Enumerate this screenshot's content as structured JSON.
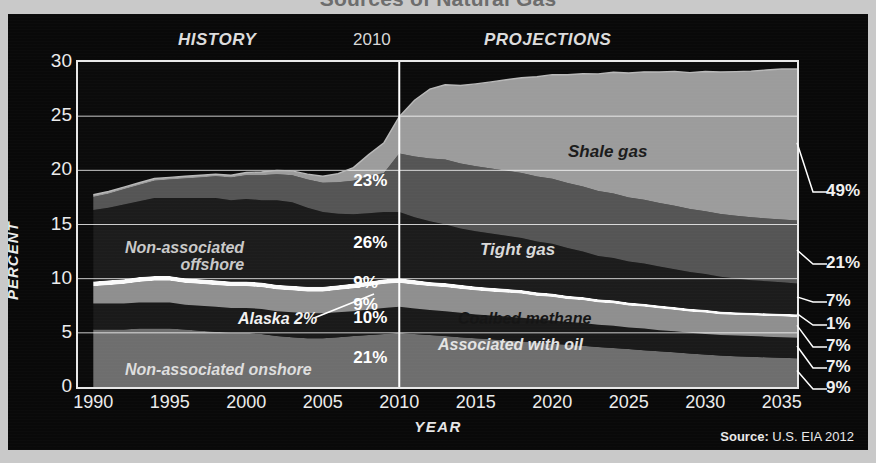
{
  "headline": "Sources of Natural Gas",
  "header": {
    "history": "HISTORY",
    "divider_year": "2010",
    "projections": "PROJECTIONS"
  },
  "source": {
    "prefix": "Source:",
    "text": " U.S. EIA 2012"
  },
  "chart_data": {
    "type": "area",
    "title": "Sources of Natural Gas",
    "xlabel": "YEAR",
    "ylabel": "PERCENT",
    "xlim": [
      1989,
      2036
    ],
    "ylim": [
      0,
      30
    ],
    "yticks": [
      0,
      5,
      10,
      15,
      20,
      25,
      30
    ],
    "ytick_labels": [
      "0",
      "5",
      "10",
      "15",
      "20",
      "25",
      "30"
    ],
    "xticks": [
      1990,
      1995,
      2000,
      2005,
      2010,
      2015,
      2020,
      2025,
      2030,
      2035
    ],
    "xtick_labels": [
      "1990",
      "1995",
      "2000",
      "2005",
      "2010",
      "2015",
      "2020",
      "2025",
      "2030",
      "2035"
    ],
    "grid": true,
    "legend": "in-plot labels",
    "divider_x": 2010,
    "stacked": true,
    "x": [
      1990,
      1991,
      1992,
      1993,
      1994,
      1995,
      1996,
      1997,
      1998,
      1999,
      2000,
      2001,
      2002,
      2003,
      2004,
      2005,
      2006,
      2007,
      2008,
      2009,
      2010,
      2011,
      2012,
      2013,
      2014,
      2015,
      2016,
      2017,
      2018,
      2019,
      2020,
      2021,
      2022,
      2023,
      2024,
      2025,
      2026,
      2027,
      2028,
      2029,
      2030,
      2031,
      2032,
      2033,
      2034,
      2035,
      2036
    ],
    "series": [
      {
        "name": "Non-associated onshore",
        "color": "#6e6e6e",
        "label_2010": "21%",
        "label_2035": "9%",
        "values": [
          5.3,
          5.3,
          5.3,
          5.4,
          5.4,
          5.4,
          5.3,
          5.2,
          5.1,
          5.0,
          5.0,
          4.9,
          4.7,
          4.6,
          4.5,
          4.5,
          4.6,
          4.7,
          4.8,
          4.9,
          5.0,
          4.9,
          4.8,
          4.7,
          4.6,
          4.5,
          4.4,
          4.3,
          4.2,
          4.1,
          4.0,
          3.9,
          3.8,
          3.7,
          3.6,
          3.5,
          3.4,
          3.3,
          3.2,
          3.1,
          3.0,
          2.9,
          2.85,
          2.8,
          2.75,
          2.7,
          2.65
        ]
      },
      {
        "name": "Associated with oil",
        "color": "#1a1a1a",
        "label_2010": "10%",
        "label_2035": "7%",
        "values": [
          2.4,
          2.4,
          2.4,
          2.4,
          2.4,
          2.4,
          2.3,
          2.3,
          2.3,
          2.3,
          2.3,
          2.3,
          2.3,
          2.3,
          2.3,
          2.3,
          2.3,
          2.3,
          2.35,
          2.4,
          2.4,
          2.35,
          2.3,
          2.3,
          2.25,
          2.2,
          2.2,
          2.2,
          2.2,
          2.15,
          2.15,
          2.1,
          2.1,
          2.05,
          2.05,
          2.0,
          2.0,
          1.95,
          1.95,
          1.9,
          1.9,
          1.9,
          1.9,
          1.9,
          1.9,
          1.9,
          1.9
        ]
      },
      {
        "name": "Coalbed methane",
        "color": "#8f8f8f",
        "label_2010": "9%",
        "label_2035": "7%",
        "values": [
          1.6,
          1.7,
          1.8,
          1.9,
          2.0,
          2.0,
          2.0,
          2.0,
          2.0,
          2.0,
          2.0,
          2.0,
          2.0,
          2.0,
          2.0,
          2.0,
          2.05,
          2.1,
          2.15,
          2.2,
          2.2,
          2.2,
          2.2,
          2.2,
          2.2,
          2.2,
          2.2,
          2.2,
          2.2,
          2.15,
          2.15,
          2.1,
          2.1,
          2.05,
          2.05,
          2.0,
          2.0,
          2.0,
          1.95,
          1.95,
          1.95,
          1.9,
          1.9,
          1.9,
          1.9,
          1.9,
          1.9
        ]
      },
      {
        "name": "Alaska",
        "color": "#fafafa",
        "label_2010": "2%",
        "label_2035": "1%",
        "values": [
          0.45,
          0.45,
          0.45,
          0.45,
          0.45,
          0.45,
          0.45,
          0.45,
          0.45,
          0.45,
          0.45,
          0.45,
          0.45,
          0.45,
          0.45,
          0.45,
          0.45,
          0.45,
          0.45,
          0.45,
          0.45,
          0.42,
          0.4,
          0.4,
          0.38,
          0.38,
          0.36,
          0.36,
          0.35,
          0.34,
          0.33,
          0.32,
          0.31,
          0.3,
          0.3,
          0.29,
          0.29,
          0.28,
          0.28,
          0.27,
          0.27,
          0.27,
          0.26,
          0.26,
          0.26,
          0.26,
          0.26
        ]
      },
      {
        "name": "Non-associated offshore",
        "color": "#1c1c1c",
        "label_2010": "26%",
        "label_2035": "7%",
        "values": [
          6.6,
          6.7,
          6.9,
          7.0,
          7.2,
          7.2,
          7.4,
          7.5,
          7.6,
          7.5,
          7.6,
          7.6,
          7.8,
          7.7,
          7.3,
          6.9,
          6.6,
          6.4,
          6.3,
          6.2,
          6.1,
          5.8,
          5.6,
          5.4,
          5.2,
          5.1,
          5.0,
          4.9,
          4.8,
          4.7,
          4.6,
          4.4,
          4.2,
          4.0,
          3.9,
          3.8,
          3.7,
          3.6,
          3.5,
          3.4,
          3.3,
          3.2,
          3.1,
          3.0,
          2.95,
          2.9,
          2.85
        ]
      },
      {
        "name": "Tight gas",
        "color": "#555555",
        "label_2010": "23%",
        "label_2035": "21%",
        "values": [
          1.2,
          1.3,
          1.4,
          1.5,
          1.6,
          1.7,
          1.8,
          1.9,
          2.0,
          2.1,
          2.2,
          2.3,
          2.4,
          2.5,
          2.6,
          2.7,
          2.9,
          3.1,
          3.4,
          3.6,
          5.4,
          5.6,
          5.8,
          6.0,
          6.0,
          6.0,
          6.0,
          6.0,
          6.0,
          6.0,
          6.0,
          6.0,
          6.0,
          6.0,
          5.95,
          5.9,
          5.9,
          5.85,
          5.85,
          5.8,
          5.8,
          5.8,
          5.8,
          5.8,
          5.8,
          5.8,
          5.8
        ]
      },
      {
        "name": "Shale gas",
        "color": "#9c9c9c",
        "label_2010": "",
        "label_2035": "49%",
        "values": [
          0.2,
          0.2,
          0.2,
          0.2,
          0.2,
          0.2,
          0.2,
          0.2,
          0.2,
          0.2,
          0.25,
          0.3,
          0.35,
          0.4,
          0.5,
          0.6,
          0.8,
          1.2,
          2.0,
          2.8,
          3.4,
          5.2,
          6.4,
          6.9,
          7.2,
          7.6,
          8.0,
          8.4,
          8.8,
          9.2,
          9.6,
          10.0,
          10.4,
          10.8,
          11.2,
          11.5,
          11.8,
          12.1,
          12.4,
          12.6,
          12.9,
          13.1,
          13.3,
          13.5,
          13.7,
          13.9,
          14.0
        ]
      }
    ],
    "callouts_2010": [
      {
        "label": "23%",
        "series": "Tight gas"
      },
      {
        "label": "26%",
        "series": "Non-associated offshore"
      },
      {
        "label": "9%",
        "series": "Coalbed methane"
      },
      {
        "label": "9%",
        "series": "Alaska-upper"
      },
      {
        "label": "10%",
        "series": "Associated with oil"
      },
      {
        "label": "21%",
        "series": "Non-associated onshore"
      }
    ],
    "callouts_2035": [
      {
        "label": "49%",
        "series": "Shale gas"
      },
      {
        "label": "21%",
        "series": "Tight gas"
      },
      {
        "label": "7%",
        "series": "Non-associated offshore"
      },
      {
        "label": "1%",
        "series": "Alaska"
      },
      {
        "label": "7%",
        "series": "Coalbed methane"
      },
      {
        "label": "7%",
        "series": "Associated with oil"
      },
      {
        "label": "9%",
        "series": "Non-associated onshore"
      }
    ],
    "inplot_labels": {
      "shale": "Shale gas",
      "tight": "Tight gas",
      "coalbed": "Coalbed methane",
      "associated": "Associated with oil",
      "nonassoc_offshore_l1": "Non-associated",
      "nonassoc_offshore_l2": "offshore",
      "nonassoc_onshore": "Non-associated onshore",
      "alaska": "Alaska 2%"
    }
  }
}
